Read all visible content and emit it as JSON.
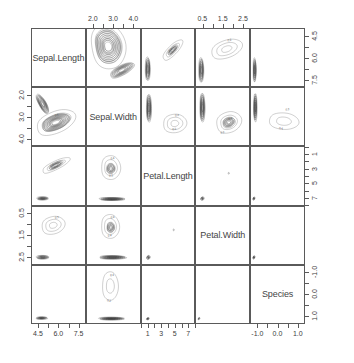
{
  "plot": {
    "type": "scatterplot-matrix",
    "title": "",
    "variables": [
      "Sepal.Length",
      "Sepal.Width",
      "Petal.Length",
      "Petal.Width",
      "Species"
    ],
    "panel_count": 25,
    "grid": 5
  },
  "axes": {
    "top": [
      {
        "col": 1,
        "labels": [],
        "shown": false
      },
      {
        "col": 2,
        "variable": "Sepal.Width",
        "labels": [
          "2.0",
          "3.0",
          "4.0"
        ],
        "values": [
          2.0,
          3.0,
          4.0
        ],
        "shown": true
      },
      {
        "col": 3,
        "labels": [],
        "shown": false
      },
      {
        "col": 4,
        "variable": "Petal.Width",
        "labels": [
          "0.5",
          "1.5",
          "2.5"
        ],
        "values": [
          0.5,
          1.5,
          2.5
        ],
        "shown": true
      },
      {
        "col": 5,
        "labels": [],
        "shown": false
      }
    ],
    "bottom": [
      {
        "col": 1,
        "variable": "Sepal.Length",
        "labels": [
          "4.5",
          "6.0",
          "7.5"
        ],
        "values": [
          4.5,
          6.0,
          7.5
        ],
        "shown": true
      },
      {
        "col": 2,
        "labels": [],
        "shown": false
      },
      {
        "col": 3,
        "variable": "Petal.Length",
        "labels": [
          "1",
          "3",
          "5",
          "7"
        ],
        "values": [
          1,
          3,
          5,
          7
        ],
        "shown": true
      },
      {
        "col": 4,
        "labels": [],
        "shown": false
      },
      {
        "col": 5,
        "variable": "Species",
        "labels": [
          "-1.0",
          "0.0",
          "1.0"
        ],
        "values": [
          -1.0,
          0.0,
          1.0
        ],
        "shown": true
      }
    ],
    "left": [
      {
        "row": 1,
        "labels": [],
        "shown": false
      },
      {
        "row": 2,
        "variable": "Sepal.Width",
        "labels": [
          "2.0",
          "3.0",
          "4.0"
        ],
        "values": [
          2.0,
          3.0,
          4.0
        ],
        "shown": true
      },
      {
        "row": 3,
        "labels": [],
        "shown": false
      },
      {
        "row": 4,
        "variable": "Petal.Width",
        "labels": [
          "0.5",
          "1.5",
          "2.5"
        ],
        "values": [
          0.5,
          1.5,
          2.5
        ],
        "shown": true
      },
      {
        "row": 5,
        "labels": [],
        "shown": false
      }
    ],
    "right": [
      {
        "row": 1,
        "variable": "Sepal.Length",
        "labels": [
          "4.5",
          "6.0",
          "7.5"
        ],
        "values": [
          4.5,
          6.0,
          7.5
        ],
        "shown": true
      },
      {
        "row": 2,
        "labels": [],
        "shown": false
      },
      {
        "row": 3,
        "variable": "Petal.Length",
        "labels": [
          "1",
          "3",
          "5",
          "7"
        ],
        "values": [
          1,
          3,
          5,
          7
        ],
        "shown": true
      },
      {
        "row": 4,
        "labels": [],
        "shown": false
      },
      {
        "row": 5,
        "variable": "Species",
        "labels": [
          "-1.0",
          "0.0",
          "1.0"
        ],
        "values": [
          -1.0,
          0.0,
          1.0
        ],
        "shown": true
      }
    ]
  },
  "diagonal_labels": [
    {
      "index": 0,
      "text": "Sepal.Length"
    },
    {
      "index": 1,
      "text": "Sepal.Width"
    },
    {
      "index": 2,
      "text": "Petal.Length"
    },
    {
      "index": 3,
      "text": "Petal.Width"
    },
    {
      "index": 4,
      "text": "Species"
    }
  ],
  "contour_labels": {
    "r1c4": [
      "0.2"
    ],
    "r2c2_left": [
      "0.6"
    ],
    "r2c3": [
      "0.4",
      "0.2"
    ],
    "r2c4": [
      "0.4",
      "0.2"
    ],
    "r2c5": [
      "0.2",
      "0.4"
    ],
    "r3c1": [
      "0.4",
      "0.2"
    ],
    "r3c2": [
      "0.4",
      "0.2"
    ],
    "r4c1": [
      "0.2"
    ],
    "r4c2": [
      "0.6",
      "0.4"
    ],
    "r5c2": [
      "0.4",
      "0.2"
    ]
  },
  "chart_data": {
    "type": "scatter",
    "title": "",
    "xlabel": "",
    "ylabel": "",
    "variables": [
      "Sepal.Length",
      "Sepal.Width",
      "Petal.Length",
      "Petal.Width",
      "Species"
    ],
    "ranges": {
      "Sepal.Length": [
        4.3,
        7.9
      ],
      "Sepal.Width": [
        2.0,
        4.4
      ],
      "Petal.Length": [
        1.0,
        6.9
      ],
      "Petal.Width": [
        0.1,
        2.5
      ],
      "Species": [
        -1.0,
        1.0
      ]
    },
    "grid": false,
    "legend": "none",
    "contour_levels": [
      0.2,
      0.4,
      0.6
    ],
    "series": [
      {
        "name": "setosa",
        "values": []
      },
      {
        "name": "versicolor+virginica",
        "values": []
      }
    ]
  }
}
